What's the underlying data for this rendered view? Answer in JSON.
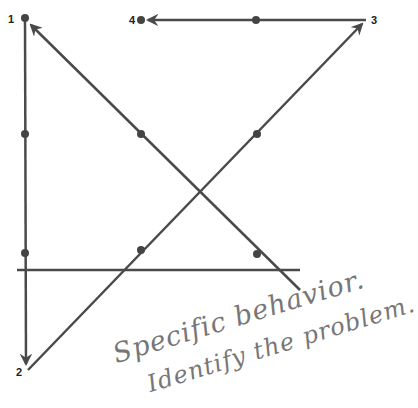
{
  "diagram": {
    "colors": {
      "line": "#4a4a4a",
      "dot": "#444444",
      "label": "#222222",
      "handwriting": "#7a7a7a"
    },
    "points": [
      {
        "label": "1",
        "x": 25,
        "y": 18
      },
      {
        "label": "2",
        "x": 27,
        "y": 370
      },
      {
        "label": "3",
        "x": 366,
        "y": 20
      },
      {
        "label": "4",
        "x": 141,
        "y": 20
      }
    ],
    "dots": [
      {
        "x": 25,
        "y": 18
      },
      {
        "x": 141,
        "y": 20
      },
      {
        "x": 256,
        "y": 20
      },
      {
        "x": 25,
        "y": 134
      },
      {
        "x": 141,
        "y": 134
      },
      {
        "x": 257,
        "y": 134
      },
      {
        "x": 25,
        "y": 253
      },
      {
        "x": 141,
        "y": 250
      },
      {
        "x": 257,
        "y": 254
      }
    ],
    "handwriting": {
      "line1": "Specific behavior.",
      "line2": "Identify the problem."
    }
  }
}
